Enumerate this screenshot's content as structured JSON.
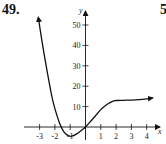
{
  "problem": {
    "number": "49.",
    "next_number_partial": "5"
  },
  "chart_data": {
    "type": "line",
    "title": "",
    "xlabel": "x",
    "ylabel": "y",
    "x_ticks": [
      -3,
      -2,
      -1,
      1,
      2,
      3,
      4
    ],
    "x_tick_labels": [
      "-3",
      "-2",
      "-1",
      "1",
      "2",
      "3",
      "4"
    ],
    "y_ticks": [
      10,
      20,
      30,
      40,
      50
    ],
    "y_tick_labels": [
      "10",
      "20",
      "30",
      "40",
      "50"
    ],
    "xlim": [
      -3.5,
      4.8
    ],
    "ylim": [
      -6,
      55
    ],
    "grid": false,
    "legend": null,
    "series": [
      {
        "name": "f(x)",
        "x": [
          -3.05,
          -2.8,
          -2.5,
          -2.2,
          -2.0,
          -1.7,
          -1.4,
          -1.1,
          -0.9,
          -0.6,
          -0.3,
          0,
          0.3,
          0.6,
          1.0,
          1.4,
          1.8,
          2.0,
          2.5,
          3.0,
          3.5,
          4.0,
          4.4
        ],
        "y": [
          52,
          40,
          27,
          15,
          9,
          2,
          -2.5,
          -4.3,
          -4.5,
          -3.5,
          -1.8,
          0,
          2.5,
          5,
          8.5,
          11,
          12.7,
          13,
          13.1,
          13.2,
          13.4,
          13.8,
          14.3
        ],
        "arrows": [
          "start",
          "end"
        ]
      }
    ]
  }
}
